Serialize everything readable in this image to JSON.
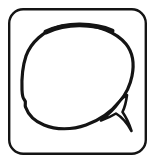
{
  "image": {
    "kind": "line-art-icon",
    "title": "Speech Bubble Icon",
    "description": "Hand-drawn speech balloon inside a rounded square frame",
    "width": 155,
    "height": 168,
    "background_color": "#ffffff",
    "ink_color": "#141414",
    "style": "monochrome black outline, no fill, hand-drawn / scanned look"
  },
  "frame": {
    "name": "rounded-square-border",
    "x": 9,
    "y": 9,
    "width": 137,
    "height": 145,
    "corner_radius": 14,
    "stroke_width": 2.4,
    "stroke_color": "#141414",
    "fill": "none"
  },
  "bubble": {
    "name": "speech-balloon",
    "shape": "irregular oval",
    "center_x": 78,
    "center_y": 78,
    "radius_x": 54,
    "radius_y": 51,
    "stroke_width": 3.2,
    "stroke_color": "#141414",
    "fill": "#ffffff",
    "notch": {
      "name": "left-side-notch",
      "x": 24,
      "y": 100,
      "note": "small inward kink on the lower-left contour"
    },
    "thick_segment": {
      "name": "top-arc-heavy-stroke",
      "from_x": 48,
      "to_x": 108,
      "y": 27,
      "stroke_width": 5.0,
      "note": "top arc is noticeably heavier / blurrier than the rest"
    }
  },
  "tail": {
    "name": "speech-bubble-tail",
    "direction": "down-right",
    "tip_x": 133,
    "tip_y": 130,
    "base_upper_x": 126,
    "base_upper_y": 98,
    "base_lower_x": 110,
    "base_lower_y": 115,
    "stroke_width": 3.0,
    "stroke_color": "#141414",
    "fill": "#ffffff"
  },
  "labels": {
    "alt_text": "Speech bubble icon in a rounded square frame"
  }
}
